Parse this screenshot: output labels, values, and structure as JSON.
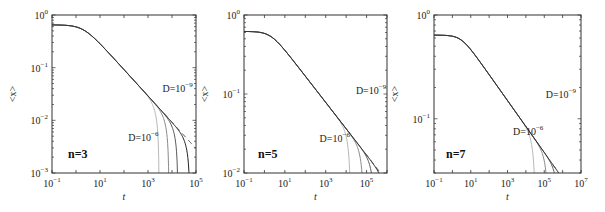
{
  "chart_data": [
    {
      "type": "line",
      "title": "",
      "panel_label": "n=3",
      "xlabel": "t",
      "ylabel": "<x>",
      "xscale": "log",
      "yscale": "log",
      "xlim": [
        0.1,
        100000
      ],
      "ylim": [
        0.001,
        1
      ],
      "xticks": [
        "10^-1",
        "10^1",
        "10^3",
        "10^5"
      ],
      "yticks": [
        "10^0",
        "10^-1",
        "10^-2",
        "10^-3"
      ],
      "grid": false,
      "annotations": [
        {
          "text": "D=10^-9",
          "x": 4000,
          "y": 0.035
        },
        {
          "text": "D=10^-6",
          "x": 150,
          "y": 0.004
        }
      ],
      "curve": {
        "plateau": 0.65,
        "tc": 2.0,
        "slope": -0.5
      },
      "series": [
        {
          "name": "D=10^-6",
          "shade": "#b8b8b8",
          "cutoff_t": 2900
        },
        {
          "name": "D=10^-7",
          "shade": "#8a8a8a",
          "cutoff_t": 7500
        },
        {
          "name": "D=10^-8",
          "shade": "#5a5a5a",
          "cutoff_t": 17800
        },
        {
          "name": "D=10^-9",
          "shade": "#222222",
          "cutoff_t": 56000
        },
        {
          "name": "power-law fit",
          "style": "dashed",
          "shade": "#444444"
        }
      ]
    },
    {
      "type": "line",
      "title": "",
      "panel_label": "n=5",
      "xlabel": "t",
      "ylabel": "<x>",
      "xscale": "log",
      "yscale": "log",
      "xlim": [
        0.1,
        1000000
      ],
      "ylim": [
        0.01,
        1
      ],
      "xticks": [
        "10^-1",
        "10^1",
        "10^3",
        "10^5"
      ],
      "yticks": [
        "10^0",
        "10^-1",
        "10^-2"
      ],
      "grid": false,
      "annotations": [
        {
          "text": "D=10^-9",
          "x": 30000,
          "y": 0.1
        },
        {
          "text": "D=10^-6",
          "x": 500,
          "y": 0.025
        }
      ],
      "curve": {
        "plateau": 0.62,
        "tc": 2.0,
        "slope": -0.333
      },
      "series": [
        {
          "name": "D=10^-6",
          "shade": "#b8b8b8",
          "cutoff_t": 17000
        },
        {
          "name": "D=10^-7",
          "shade": "#8a8a8a",
          "cutoff_t": 75000
        },
        {
          "name": "D=10^-8",
          "shade": "#5a5a5a",
          "cutoff_t": 260000
        },
        {
          "name": "D=10^-9",
          "shade": "#222222",
          "cutoff_t": 1000000
        },
        {
          "name": "power-law fit",
          "style": "dashed",
          "shade": "#444444"
        }
      ]
    },
    {
      "type": "line",
      "title": "",
      "panel_label": "n=7",
      "xlabel": "t",
      "ylabel": "<x>",
      "xscale": "log",
      "yscale": "log",
      "xlim": [
        0.1,
        10000000
      ],
      "ylim": [
        0.03,
        1
      ],
      "xticks": [
        "10^-1",
        "10^1",
        "10^3",
        "10^5",
        "10^7"
      ],
      "yticks": [
        "10^0",
        "10^-1"
      ],
      "grid": false,
      "annotations": [
        {
          "text": "D=10^-9",
          "x": 120000,
          "y": 0.16
        },
        {
          "text": "D=10^-6",
          "x": 2000,
          "y": 0.07
        }
      ],
      "curve": {
        "plateau": 0.64,
        "tc": 3.0,
        "slope": -0.25
      },
      "series": [
        {
          "name": "D=10^-6",
          "shade": "#b8b8b8",
          "cutoff_t": 35000
        },
        {
          "name": "D=10^-7",
          "shade": "#8a8a8a",
          "cutoff_t": 180000
        },
        {
          "name": "D=10^-8",
          "shade": "#5a5a5a",
          "cutoff_t": 700000
        },
        {
          "name": "D=10^-9",
          "shade": "#222222",
          "cutoff_t": 3500000
        },
        {
          "name": "power-law fit",
          "style": "dashed",
          "shade": "#444444"
        }
      ]
    }
  ],
  "layout": {
    "panels": [
      {
        "left": 52,
        "top": 15,
        "right": 196,
        "bottom": 173,
        "tag_x": 68,
        "tag_y": 158
      },
      {
        "left": 244,
        "top": 15,
        "right": 387,
        "bottom": 173,
        "tag_x": 258,
        "tag_y": 158
      },
      {
        "left": 434,
        "top": 15,
        "right": 581,
        "bottom": 173,
        "tag_x": 446,
        "tag_y": 158
      }
    ]
  }
}
